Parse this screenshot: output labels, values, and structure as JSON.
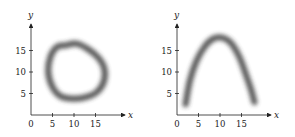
{
  "chart_data": [
    {
      "type": "line",
      "title": "",
      "xlabel": "x",
      "ylabel": "y",
      "xlim": [
        0,
        20
      ],
      "ylim": [
        0,
        20
      ],
      "x_ticks": [
        0,
        5,
        10,
        15
      ],
      "y_ticks": [
        5,
        10,
        15
      ],
      "grid": false,
      "legend": null,
      "description": "Blurred closed irregular loop (ring) centered near (10,10)",
      "series": [
        {
          "name": "ring",
          "x": [
            4,
            4.5,
            6,
            8,
            10.5,
            13,
            15.5,
            17,
            17,
            15.5,
            13,
            10,
            7,
            5,
            4
          ],
          "y": [
            10,
            13.5,
            15.8,
            16.2,
            16.6,
            15.5,
            13.5,
            11,
            8,
            5.5,
            4.2,
            3.8,
            4.3,
            6.5,
            10
          ]
        }
      ]
    },
    {
      "type": "line",
      "title": "",
      "xlabel": "x",
      "ylabel": "y",
      "xlim": [
        0,
        20
      ],
      "ylim": [
        0,
        20
      ],
      "x_ticks": [
        0,
        5,
        10,
        15
      ],
      "y_ticks": [
        5,
        10,
        15
      ],
      "grid": false,
      "legend": null,
      "description": "Blurred open arch (inverted parabola-like curve)",
      "series": [
        {
          "name": "arch",
          "x": [
            2,
            3,
            4.5,
            6.5,
            8.5,
            10.5,
            12.5,
            14.5,
            16,
            17.2,
            18
          ],
          "y": [
            2.5,
            8,
            12.5,
            16,
            17.8,
            18,
            16.8,
            13.5,
            9.5,
            6,
            3
          ]
        }
      ]
    }
  ],
  "plots": [
    {
      "x_axis_label": "x",
      "y_axis_label": "y",
      "x_tick_labels": [
        "0",
        "5",
        "10",
        "15"
      ],
      "y_tick_labels": [
        "5",
        "10",
        "15"
      ]
    },
    {
      "x_axis_label": "x",
      "y_axis_label": "y",
      "x_tick_labels": [
        "0",
        "5",
        "10",
        "15"
      ],
      "y_tick_labels": [
        "5",
        "10",
        "15"
      ]
    }
  ]
}
